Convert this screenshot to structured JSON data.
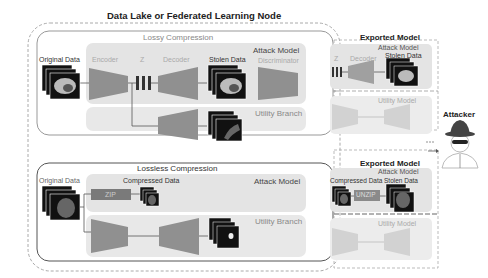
{
  "title": "Data Lake or Federated Learning Node",
  "lossy": {
    "title": "Lossy Compression",
    "original_label": "Original Data",
    "encoder_label": "Encoder",
    "z_label": "Z",
    "decoder_label": "Decoder",
    "stolen_label": "Stolen Data",
    "attack_label": "Attack Model",
    "discriminator_label": "Discriminator",
    "utility_label": "Utility Branch"
  },
  "lossless": {
    "title": "Lossless Compression",
    "original_label": "Original Data",
    "compressed_label": "Compressed Data",
    "zip_label": "ZIP",
    "attack_label": "Attack Model",
    "utility_label": "Utility Branch"
  },
  "exported_top": {
    "title": "Exported Model",
    "attack_label": "Attack Model",
    "z_label": "Z",
    "decoder_label": "Decoder",
    "stolen_label": "Stolen Data",
    "utility_label": "Utility Model"
  },
  "exported_bottom": {
    "title": "Exported Model",
    "attack_label": "Attack Model",
    "compressed_label": "Compressed Data",
    "stolen_label": "Stolen Data",
    "unzip_label": "UNZIP",
    "utility_label": "Utility Model"
  },
  "attacker_label": "Attacker",
  "colors": {
    "panel": "#e6e6e6",
    "trapezoid": "#8f8f8f",
    "trapezoid_light": "#d2d2d2",
    "zip_box": "#7a7a7a"
  }
}
